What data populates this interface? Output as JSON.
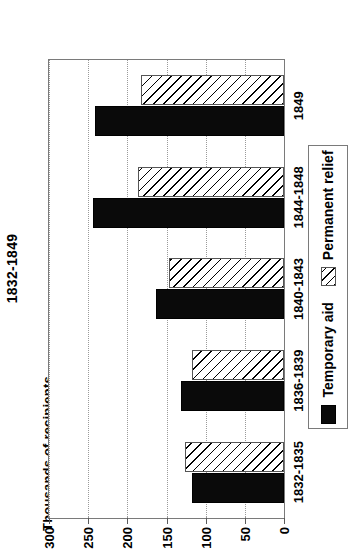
{
  "chart_data": {
    "type": "bar",
    "orientation": "horizontal",
    "title": "1832-1849",
    "xlabel": "",
    "ylabel": "Thousands of recipients",
    "categories": [
      "1832-1835",
      "1836-1839",
      "1840-1843",
      "1844-1848",
      "1849"
    ],
    "series": [
      {
        "name": "Temporary aid",
        "values": [
          117,
          132,
          164,
          244,
          241
        ],
        "color": "#0a0a0a",
        "fill": "solid"
      },
      {
        "name": "Permanent relief",
        "values": [
          127,
          117,
          147,
          187,
          182
        ],
        "color": "#ffffff",
        "fill": "diagonal-hatch"
      }
    ],
    "ylim": [
      0,
      300
    ],
    "yticks": [
      0,
      50,
      100,
      150,
      200,
      250,
      300
    ],
    "ytick_labels": [
      "0",
      "50",
      "100",
      "150",
      "200",
      "250",
      "300"
    ],
    "grid": true,
    "grid_style": "dotted",
    "legend_position": "bottom",
    "axis_color": "#7a7a7a"
  },
  "legend": {
    "items": [
      {
        "label": "Temporary aid"
      },
      {
        "label": "Permanent relief"
      }
    ]
  }
}
